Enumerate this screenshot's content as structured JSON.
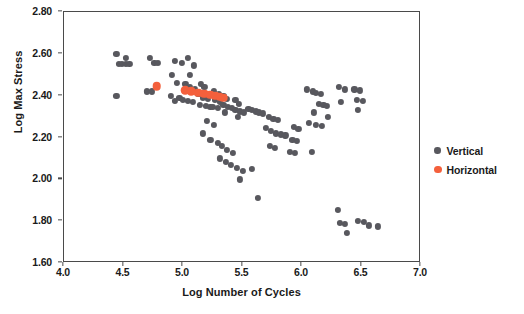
{
  "chart_data": {
    "type": "scatter",
    "title": "",
    "xlabel": "Log Number of Cycles",
    "ylabel": "Log Max Stress",
    "xlim": [
      4.0,
      7.0
    ],
    "ylim": [
      1.6,
      2.8
    ],
    "xticks": [
      "4.0",
      "4.5",
      "5.0",
      "5.5",
      "6.0",
      "6.5",
      "7.0"
    ],
    "xtick_values": [
      4.0,
      4.5,
      5.0,
      5.5,
      6.0,
      6.5,
      7.0
    ],
    "yticks": [
      "1.60",
      "1.80",
      "2.00",
      "2.20",
      "2.40",
      "2.60",
      "2.80"
    ],
    "ytick_values": [
      1.6,
      1.8,
      2.0,
      2.2,
      2.4,
      2.6,
      2.8
    ],
    "grid": false,
    "legend_position": "right",
    "colors": {
      "vertical": "#58585e",
      "horizontal": "#f4603c",
      "axis": "#4a4a4a",
      "text": "#1a1a1a",
      "background": "#ffffff"
    },
    "series": [
      {
        "name": "Vertical",
        "color": "#58585e",
        "marker": "circle",
        "points": [
          [
            4.44,
            2.6
          ],
          [
            4.52,
            2.58
          ],
          [
            4.46,
            2.55
          ],
          [
            4.49,
            2.55
          ],
          [
            4.52,
            2.55
          ],
          [
            4.55,
            2.55
          ],
          [
            4.44,
            2.4
          ],
          [
            4.72,
            2.58
          ],
          [
            4.76,
            2.555
          ],
          [
            4.79,
            2.555
          ],
          [
            4.7,
            2.42
          ],
          [
            4.74,
            2.42
          ],
          [
            4.93,
            2.565
          ],
          [
            4.99,
            2.555
          ],
          [
            4.91,
            2.5
          ],
          [
            4.95,
            2.46
          ],
          [
            4.9,
            2.4
          ],
          [
            4.97,
            2.39
          ],
          [
            4.93,
            2.375
          ],
          [
            5.04,
            2.58
          ],
          [
            5.09,
            2.545
          ],
          [
            5.06,
            2.5
          ],
          [
            5.02,
            2.455
          ],
          [
            5.06,
            2.44
          ],
          [
            5.1,
            2.43
          ],
          [
            5.0,
            2.38
          ],
          [
            5.04,
            2.375
          ],
          [
            5.08,
            2.37
          ],
          [
            5.15,
            2.455
          ],
          [
            5.18,
            2.44
          ],
          [
            5.13,
            2.41
          ],
          [
            5.17,
            2.39
          ],
          [
            5.21,
            2.385
          ],
          [
            5.14,
            2.355
          ],
          [
            5.19,
            2.35
          ],
          [
            5.23,
            2.345
          ],
          [
            5.26,
            2.42
          ],
          [
            5.3,
            2.41
          ],
          [
            5.27,
            2.38
          ],
          [
            5.31,
            2.37
          ],
          [
            5.25,
            2.345
          ],
          [
            5.29,
            2.34
          ],
          [
            5.34,
            2.4
          ],
          [
            5.37,
            2.385
          ],
          [
            5.34,
            2.355
          ],
          [
            5.38,
            2.345
          ],
          [
            5.41,
            2.34
          ],
          [
            5.35,
            2.32
          ],
          [
            5.44,
            2.38
          ],
          [
            5.47,
            2.36
          ],
          [
            5.44,
            2.33
          ],
          [
            5.48,
            2.325
          ],
          [
            5.51,
            2.32
          ],
          [
            5.46,
            2.3
          ],
          [
            5.55,
            2.335
          ],
          [
            5.58,
            2.33
          ],
          [
            5.61,
            2.325
          ],
          [
            5.64,
            2.32
          ],
          [
            5.67,
            2.315
          ],
          [
            5.2,
            2.28
          ],
          [
            5.26,
            2.26
          ],
          [
            5.17,
            2.22
          ],
          [
            5.23,
            2.19
          ],
          [
            5.29,
            2.175
          ],
          [
            5.33,
            2.16
          ],
          [
            5.37,
            2.14
          ],
          [
            5.42,
            2.125
          ],
          [
            5.31,
            2.1
          ],
          [
            5.36,
            2.085
          ],
          [
            5.4,
            2.07
          ],
          [
            5.45,
            2.055
          ],
          [
            5.5,
            2.04
          ],
          [
            5.48,
            2.0
          ],
          [
            5.72,
            2.3
          ],
          [
            5.76,
            2.29
          ],
          [
            5.8,
            2.285
          ],
          [
            5.7,
            2.245
          ],
          [
            5.74,
            2.23
          ],
          [
            5.78,
            2.22
          ],
          [
            5.82,
            2.215
          ],
          [
            5.86,
            2.21
          ],
          [
            5.73,
            2.16
          ],
          [
            5.77,
            2.15
          ],
          [
            5.58,
            2.05
          ],
          [
            5.63,
            1.91
          ],
          [
            5.93,
            2.25
          ],
          [
            5.97,
            2.24
          ],
          [
            5.92,
            2.19
          ],
          [
            5.96,
            2.185
          ],
          [
            5.9,
            2.13
          ],
          [
            5.94,
            2.125
          ],
          [
            6.04,
            2.43
          ],
          [
            6.09,
            2.42
          ],
          [
            6.12,
            2.415
          ],
          [
            6.16,
            2.41
          ],
          [
            6.14,
            2.36
          ],
          [
            6.18,
            2.355
          ],
          [
            6.21,
            2.35
          ],
          [
            6.1,
            2.32
          ],
          [
            6.22,
            2.3
          ],
          [
            6.06,
            2.27
          ],
          [
            6.12,
            2.26
          ],
          [
            6.17,
            2.255
          ],
          [
            6.08,
            2.13
          ],
          [
            6.31,
            2.44
          ],
          [
            6.36,
            2.43
          ],
          [
            6.33,
            2.37
          ],
          [
            6.44,
            2.43
          ],
          [
            6.49,
            2.425
          ],
          [
            6.46,
            2.38
          ],
          [
            6.51,
            2.375
          ],
          [
            6.47,
            2.33
          ],
          [
            6.3,
            1.855
          ],
          [
            6.32,
            1.79
          ],
          [
            6.36,
            1.785
          ],
          [
            6.38,
            1.745
          ],
          [
            6.47,
            1.8
          ],
          [
            6.52,
            1.795
          ],
          [
            6.56,
            1.78
          ],
          [
            6.64,
            1.775
          ]
        ]
      },
      {
        "name": "Horizontal",
        "color": "#f4603c",
        "marker": "circle",
        "points": [
          [
            4.78,
            2.445
          ],
          [
            5.02,
            2.425
          ],
          [
            5.07,
            2.42
          ],
          [
            5.13,
            2.415
          ],
          [
            5.18,
            2.41
          ],
          [
            5.23,
            2.405
          ],
          [
            5.27,
            2.4
          ],
          [
            5.31,
            2.395
          ],
          [
            5.34,
            2.39
          ]
        ]
      }
    ]
  },
  "legend": {
    "items": [
      {
        "label": "Vertical",
        "key": "vertical"
      },
      {
        "label": "Horizontal",
        "key": "horizontal"
      }
    ]
  }
}
